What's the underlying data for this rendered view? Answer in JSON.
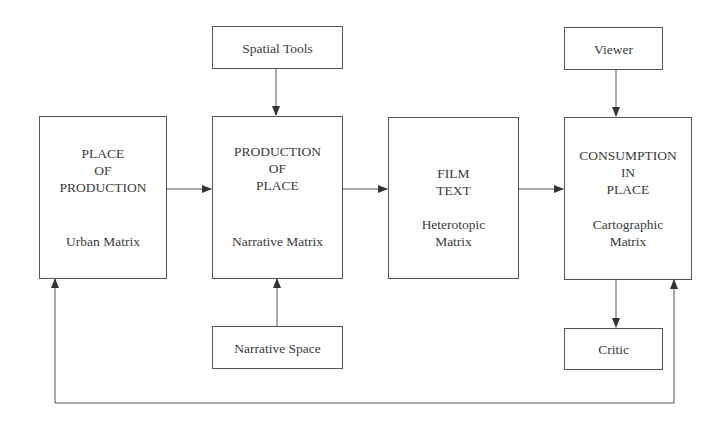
{
  "diagram": {
    "nodes": {
      "spatial_tools": {
        "label": "Spatial Tools"
      },
      "viewer": {
        "label": "Viewer"
      },
      "place_of_production": {
        "title": "PLACE\nOF\nPRODUCTION",
        "subtitle": "Urban Matrix"
      },
      "production_of_place": {
        "title": "PRODUCTION\nOF\nPLACE",
        "subtitle": "Narrative Matrix"
      },
      "film_text": {
        "title": "FILM\nTEXT",
        "subtitle": "Heterotopic\nMatrix"
      },
      "consumption_in_place": {
        "title": "CONSUMPTION\nIN\nPLACE",
        "subtitle": "Cartographic\nMatrix"
      },
      "narrative_space": {
        "label": "Narrative Space"
      },
      "critic": {
        "label": "Critic"
      }
    },
    "edges": [
      {
        "from": "Place of Production",
        "to": "Production of Place"
      },
      {
        "from": "Production of Place",
        "to": "Film Text"
      },
      {
        "from": "Film Text",
        "to": "Consumption in Place"
      },
      {
        "from": "Spatial Tools",
        "to": "Production of Place"
      },
      {
        "from": "Viewer",
        "to": "Consumption in Place"
      },
      {
        "from": "Narrative Space",
        "to": "Production of Place"
      },
      {
        "from": "Consumption in Place",
        "to": "Critic"
      },
      {
        "from": "feedback loop",
        "to": "Place of Production"
      },
      {
        "from": "feedback loop",
        "to": "Consumption in Place"
      }
    ]
  }
}
